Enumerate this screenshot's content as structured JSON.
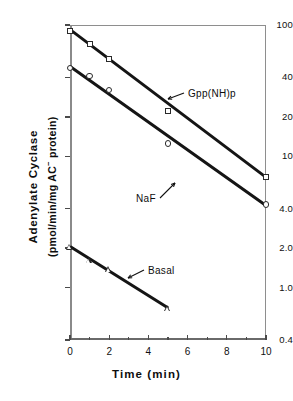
{
  "chart_data": {
    "type": "line",
    "title": "",
    "xlabel": "Time (min)",
    "ylabel_line1": "Adenylate Cyclase",
    "ylabel_line2_pre": "(pmol/min/mg AC",
    "ylabel_line2_sup": "−",
    "ylabel_line2_post": " protein)",
    "yscale": "log",
    "ylim": [
      0.4,
      100
    ],
    "xlim": [
      0,
      10
    ],
    "grid": false,
    "legend": "inline-annotations",
    "xticks": [
      0,
      2,
      4,
      6,
      8,
      10
    ],
    "xtick_labels": [
      "0",
      "2",
      "4",
      "6",
      "8",
      "10"
    ],
    "xticks_minor": [
      1,
      3,
      5,
      7,
      9
    ],
    "yticks": [
      100,
      40,
      20,
      10,
      4.0,
      2.0,
      1.0,
      0.4
    ],
    "ytick_labels": [
      "100",
      "40",
      "20",
      "10",
      "4.0",
      "2.0",
      "1.0",
      "0.4"
    ],
    "series": [
      {
        "name": "Gpp(NH)p",
        "marker": "square",
        "x": [
          0,
          1,
          2,
          5,
          10
        ],
        "values": [
          90,
          72,
          55,
          22,
          7.0
        ],
        "fit_x": [
          0,
          10
        ],
        "fit_y": [
          92,
          6.9
        ]
      },
      {
        "name": "NaF",
        "marker": "circle",
        "x": [
          0,
          1,
          2,
          5,
          10
        ],
        "values": [
          47,
          41,
          32,
          12.5,
          4.3
        ],
        "fit_x": [
          0,
          10
        ],
        "fit_y": [
          48,
          4.2
        ]
      },
      {
        "name": "Basal",
        "marker": "triangle",
        "x": [
          0,
          1,
          2,
          5
        ],
        "values": [
          2.05,
          1.62,
          1.38,
          0.7
        ],
        "fit_x": [
          0,
          5
        ],
        "fit_y": [
          2.05,
          0.7
        ]
      }
    ],
    "annotations": [
      {
        "text": "Gpp(NH)p",
        "series": "Gpp(NH)p",
        "arrow": "up-left"
      },
      {
        "text": "NaF",
        "series": "NaF",
        "arrow": "up-right"
      },
      {
        "text": "Basal",
        "series": "Basal",
        "arrow": "up-left"
      }
    ]
  }
}
